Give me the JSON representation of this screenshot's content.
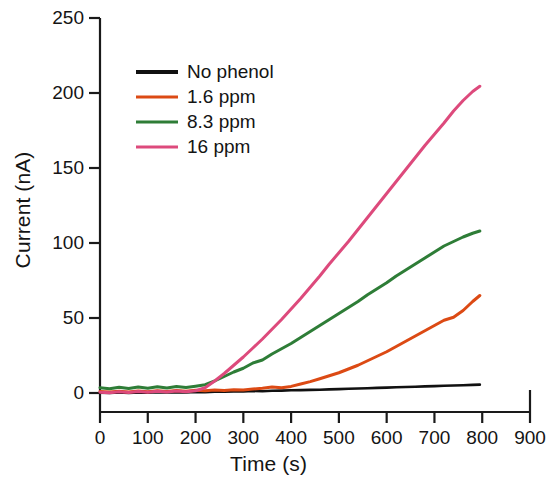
{
  "chart_data": {
    "type": "line",
    "title": "",
    "xlabel": "Time (s)",
    "ylabel": "Current (nA)",
    "xlim": [
      0,
      900
    ],
    "ylim": [
      0,
      250
    ],
    "xticks": [
      0,
      100,
      200,
      300,
      400,
      500,
      600,
      700,
      800,
      900
    ],
    "yticks": [
      0,
      50,
      100,
      150,
      200,
      250
    ],
    "xtick_labels": [
      "0",
      "100",
      "200",
      "300",
      "400",
      "500",
      "600",
      "700",
      "800",
      "900"
    ],
    "ytick_labels": [
      "0",
      "50",
      "100",
      "150",
      "200",
      "250"
    ],
    "grid": false,
    "legend_position": "upper left",
    "series": [
      {
        "name": "No phenol",
        "color": "#111111",
        "x": [
          0,
          20,
          40,
          60,
          80,
          100,
          120,
          140,
          160,
          180,
          200,
          220,
          240,
          260,
          280,
          300,
          320,
          340,
          360,
          380,
          400,
          420,
          440,
          460,
          480,
          500,
          520,
          540,
          560,
          580,
          600,
          620,
          640,
          660,
          680,
          700,
          720,
          740,
          760,
          780,
          795
        ],
        "y": [
          0.2,
          0.0,
          0.3,
          0.1,
          0.4,
          0.2,
          0.5,
          0.3,
          0.6,
          0.4,
          0.7,
          0.6,
          0.9,
          0.8,
          1.1,
          1.0,
          1.3,
          1.2,
          1.5,
          1.6,
          1.8,
          1.9,
          2.1,
          2.2,
          2.4,
          2.6,
          2.8,
          3.0,
          3.2,
          3.4,
          3.6,
          3.8,
          4.0,
          4.2,
          4.4,
          4.6,
          4.8,
          5.0,
          5.2,
          5.4,
          5.6
        ]
      },
      {
        "name": "1.6 ppm",
        "color": "#DC4A14",
        "x": [
          0,
          20,
          40,
          60,
          80,
          100,
          120,
          140,
          160,
          180,
          200,
          220,
          240,
          260,
          280,
          300,
          320,
          340,
          360,
          380,
          400,
          420,
          440,
          460,
          480,
          500,
          520,
          540,
          560,
          580,
          600,
          620,
          640,
          660,
          680,
          700,
          720,
          740,
          760,
          780,
          795
        ],
        "y": [
          1.0,
          0.6,
          1.2,
          0.7,
          1.4,
          0.9,
          1.5,
          1.0,
          1.6,
          1.2,
          1.8,
          1.5,
          2.0,
          1.7,
          2.2,
          2.0,
          2.6,
          3.2,
          4.0,
          3.5,
          4.4,
          6.0,
          7.6,
          9.5,
          11.5,
          13.5,
          16.0,
          18.5,
          21.5,
          24.5,
          27.5,
          31.0,
          34.5,
          38.0,
          41.5,
          45.0,
          48.5,
          50.5,
          55.0,
          61.0,
          65.0
        ]
      },
      {
        "name": "8.3 ppm",
        "color": "#2E7D37",
        "x": [
          0,
          20,
          40,
          60,
          80,
          100,
          120,
          140,
          160,
          180,
          200,
          220,
          240,
          260,
          280,
          300,
          320,
          340,
          360,
          380,
          400,
          420,
          440,
          460,
          480,
          500,
          520,
          540,
          560,
          580,
          600,
          620,
          640,
          660,
          680,
          700,
          720,
          740,
          760,
          780,
          795
        ],
        "y": [
          3.5,
          2.8,
          3.8,
          3.0,
          4.0,
          3.2,
          4.2,
          3.4,
          4.3,
          3.6,
          4.5,
          5.5,
          8.0,
          11.0,
          14.0,
          16.5,
          20.0,
          22.0,
          26.0,
          29.5,
          33.0,
          37.0,
          41.0,
          45.0,
          49.0,
          53.0,
          57.0,
          61.0,
          65.5,
          69.5,
          73.5,
          78.0,
          82.0,
          86.0,
          90.0,
          94.0,
          98.0,
          101.0,
          104.0,
          106.5,
          108.0
        ]
      },
      {
        "name": "16 ppm",
        "color": "#DD4A7C",
        "x": [
          0,
          20,
          40,
          60,
          80,
          100,
          120,
          140,
          160,
          180,
          200,
          220,
          240,
          260,
          280,
          300,
          320,
          340,
          360,
          380,
          400,
          420,
          440,
          460,
          480,
          500,
          520,
          540,
          560,
          580,
          600,
          620,
          640,
          660,
          680,
          700,
          720,
          740,
          760,
          780,
          795
        ],
        "y": [
          0.5,
          0.2,
          0.8,
          0.3,
          1.0,
          0.5,
          1.2,
          0.6,
          1.3,
          0.8,
          1.5,
          3.5,
          8.0,
          13.0,
          18.5,
          24.0,
          30.0,
          36.0,
          42.5,
          49.0,
          56.0,
          63.0,
          70.5,
          78.0,
          86.0,
          93.5,
          101.0,
          109.0,
          117.0,
          125.0,
          133.0,
          141.0,
          149.0,
          157.0,
          165.0,
          172.5,
          180.0,
          188.0,
          195.0,
          201.0,
          204.5
        ]
      }
    ]
  },
  "legend": {
    "entries": [
      {
        "label": "No phenol",
        "color": "#111111"
      },
      {
        "label": "1.6 ppm",
        "color": "#DC4A14"
      },
      {
        "label": "8.3 ppm",
        "color": "#2E7D37"
      },
      {
        "label": "16 ppm",
        "color": "#DD4A7C"
      }
    ]
  }
}
